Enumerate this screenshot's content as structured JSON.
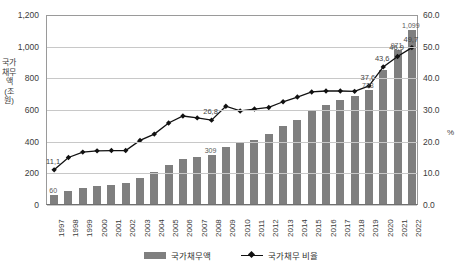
{
  "chart_data": {
    "type": "bar",
    "title": "",
    "xlabel": "",
    "ylabel": "국가채무액 (조원)",
    "y2label": "%",
    "ylim": [
      0,
      1200
    ],
    "y2lim": [
      0,
      60
    ],
    "grid": true,
    "legend_position": "bottom",
    "categories": [
      "1997",
      "1998",
      "1999",
      "2000",
      "2001",
      "2002",
      "2003",
      "2004",
      "2005",
      "2006",
      "2007",
      "2008",
      "2009",
      "2010",
      "2011",
      "2012",
      "2013",
      "2014",
      "2015",
      "2016",
      "2017",
      "2018",
      "2019",
      "2020",
      "2021",
      "2022"
    ],
    "y_ticks": [
      "0",
      "200",
      "400",
      "600",
      "800",
      "1,000",
      "1,200"
    ],
    "y2_ticks": [
      "0.0",
      "10.0",
      "20.0",
      "30.0",
      "40.0",
      "50.0",
      "60.0"
    ],
    "series": [
      {
        "name": "국가채무액",
        "type": "bar",
        "axis": "left",
        "unit": "조원",
        "values": [
          60,
          80,
          98,
          111,
          122,
          134,
          166,
          204,
          248,
          282,
          299,
          309,
          360,
          392,
          403,
          443,
          490,
          533,
          591,
          627,
          660,
          680,
          723,
          847,
          971,
          1099
        ],
        "labels": {
          "1997": "60",
          "2008": "309",
          "2019": "723",
          "2021": "971",
          "2022": "1,099"
        }
      },
      {
        "name": "국가채무 비율",
        "type": "line",
        "axis": "right",
        "unit": "%",
        "values": [
          11.1,
          15.0,
          16.7,
          17.1,
          17.2,
          17.2,
          20.4,
          22.4,
          25.9,
          28.1,
          27.5,
          26.8,
          31.2,
          29.7,
          30.3,
          30.8,
          32.6,
          34.1,
          35.7,
          36.0,
          36.0,
          35.9,
          37.6,
          43.6,
          46.9,
          49.7
        ],
        "labels": {
          "1997": "11,1",
          "2008": "26,8",
          "2019": "37,6",
          "2020": "43,6",
          "2021": "46,9",
          "2022": "49,7"
        }
      }
    ],
    "colors": {
      "bar": "#7f7f7f",
      "line": "#111111",
      "grid": "#c8c8c8",
      "axis": "#6f6f6f",
      "text": "#3b3b3b"
    }
  }
}
